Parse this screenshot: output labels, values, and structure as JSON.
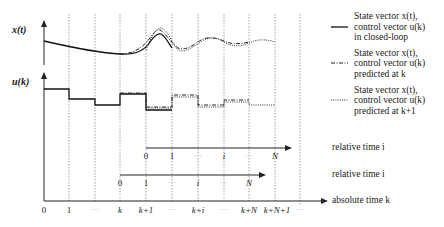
{
  "diagram": {
    "type": "MPC receding horizon timing diagram",
    "axes": {
      "x_state_label": "x(t)",
      "u_control_label": "u(k)"
    },
    "legend": [
      {
        "style": "solid",
        "line1": "State vector x(t),",
        "line2": "control vector u(k)",
        "line3": "in closed-loop"
      },
      {
        "style": "dash-dot",
        "line1": "State vector x(t),",
        "line2": "control vector u(k)",
        "line3": "predicted at k"
      },
      {
        "style": "dotted",
        "line1": "State vector x(t),",
        "line2": "control vector u(k)",
        "line3": "predicted at k+1"
      }
    ],
    "relative_axis_upper": {
      "label": "relative time i",
      "ticks": [
        "0",
        "1",
        "···",
        "i",
        "···",
        "N"
      ]
    },
    "relative_axis_lower": {
      "label": "relative time i",
      "ticks": [
        "0",
        "1",
        "···",
        "i",
        "···",
        "N"
      ]
    },
    "absolute_axis": {
      "label": "absolute time k",
      "ticks": [
        "0",
        "1",
        "···",
        "k",
        "k+1",
        "···",
        "k+i",
        "···",
        "k+N",
        "k+N+1",
        "···"
      ]
    }
  }
}
